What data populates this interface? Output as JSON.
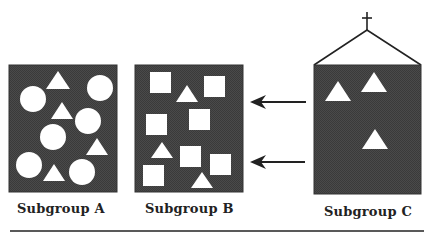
{
  "diagram": {
    "colors": {
      "box_fill": "#474747",
      "box_stroke": "#333333",
      "shape_fill": "#ffffff",
      "line": "#222222"
    },
    "subgroups": [
      {
        "id": "A",
        "label": "Subgroup A",
        "box": {
          "x": 9,
          "y": 65,
          "w": 108,
          "h": 127
        },
        "shapes": [
          {
            "type": "triangle",
            "apex": [
              58,
              71
            ],
            "base_y": 89,
            "base_x": [
              46,
              70
            ]
          },
          {
            "type": "circle",
            "cx": 100,
            "cy": 88,
            "r": 13
          },
          {
            "type": "circle",
            "cx": 33,
            "cy": 99,
            "r": 13
          },
          {
            "type": "triangle",
            "apex": [
              62,
              102
            ],
            "base_y": 119,
            "base_x": [
              51,
              73
            ]
          },
          {
            "type": "circle",
            "cx": 88,
            "cy": 121,
            "r": 13
          },
          {
            "type": "circle",
            "cx": 53,
            "cy": 137,
            "r": 13
          },
          {
            "type": "triangle",
            "apex": [
              97,
              138
            ],
            "base_y": 155,
            "base_x": [
              86,
              108
            ]
          },
          {
            "type": "circle",
            "cx": 29,
            "cy": 165,
            "r": 13
          },
          {
            "type": "triangle",
            "apex": [
              54,
              164
            ],
            "base_y": 181,
            "base_x": [
              43,
              65
            ]
          },
          {
            "type": "circle",
            "cx": 82,
            "cy": 172,
            "r": 13
          }
        ]
      },
      {
        "id": "B",
        "label": "Subgroup B",
        "box": {
          "x": 135,
          "y": 65,
          "w": 108,
          "h": 127
        },
        "shapes": [
          {
            "type": "square",
            "x": 150,
            "y": 72,
            "s": 21
          },
          {
            "type": "triangle",
            "apex": [
              187,
              85
            ],
            "base_y": 102,
            "base_x": [
              176,
              198
            ]
          },
          {
            "type": "square",
            "x": 204,
            "y": 76,
            "s": 21
          },
          {
            "type": "square",
            "x": 146,
            "y": 114,
            "s": 21
          },
          {
            "type": "square",
            "x": 189,
            "y": 109,
            "s": 21
          },
          {
            "type": "triangle",
            "apex": [
              162,
              142
            ],
            "base_y": 158,
            "base_x": [
              151,
              173
            ]
          },
          {
            "type": "square",
            "x": 180,
            "y": 146,
            "s": 21
          },
          {
            "type": "square",
            "x": 210,
            "y": 154,
            "s": 21
          },
          {
            "type": "square",
            "x": 143,
            "y": 165,
            "s": 21
          },
          {
            "type": "triangle",
            "apex": [
              202,
              172
            ],
            "base_y": 188,
            "base_x": [
              191,
              213
            ]
          }
        ]
      },
      {
        "id": "C",
        "label": "Subgroup C",
        "box": {
          "x": 314,
          "y": 65,
          "w": 107,
          "h": 129
        },
        "roof": {
          "apex": [
            367,
            30
          ],
          "left": [
            314,
            65
          ],
          "right": [
            421,
            65
          ]
        },
        "cross": {
          "x": 367,
          "y_top": 12,
          "y_bottom": 30,
          "arm_y": 18,
          "arm_half": 5
        },
        "shapes": [
          {
            "type": "triangle",
            "apex": [
              338,
              81
            ],
            "base_y": 101,
            "base_x": [
              325,
              351
            ]
          },
          {
            "type": "triangle",
            "apex": [
              374,
              72
            ],
            "base_y": 92,
            "base_x": [
              361,
              387
            ]
          },
          {
            "type": "triangle",
            "apex": [
              375,
              129
            ],
            "base_y": 149,
            "base_x": [
              362,
              388
            ]
          }
        ]
      }
    ],
    "arrows": [
      {
        "from": [
          306,
          102
        ],
        "to": [
          250,
          102
        ],
        "direction": "left"
      },
      {
        "from": [
          305,
          162
        ],
        "to": [
          250,
          162
        ],
        "direction": "left"
      }
    ],
    "labels": [
      {
        "text": "Subgroup A",
        "x": 17,
        "y": 202
      },
      {
        "text": "Subgroup B",
        "x": 145,
        "y": 202
      },
      {
        "text": "Subgroup C",
        "x": 324,
        "y": 205
      }
    ],
    "rule": {
      "x1": 10,
      "x2": 424,
      "y": 231
    }
  }
}
